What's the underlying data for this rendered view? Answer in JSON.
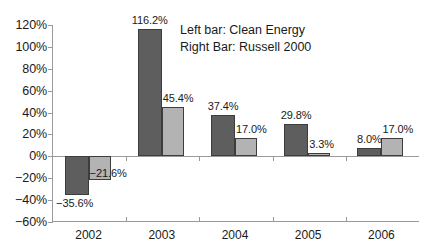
{
  "chart_data": {
    "type": "bar",
    "title": "",
    "subtitle": "",
    "xlabel": "",
    "ylabel": "",
    "categories": [
      "2002",
      "2003",
      "2004",
      "2005",
      "2006"
    ],
    "series": [
      {
        "name": "Clean Energy",
        "color": "#5e5e5e",
        "values": [
          -35.6,
          116.2,
          37.4,
          29.8,
          8.0
        ],
        "labels": [
          "−35.6%",
          "116.2%",
          "37.4%",
          "29.8%",
          "8.0%"
        ]
      },
      {
        "name": "Russell 2000",
        "color": "#b3b3b3",
        "values": [
          -21.6,
          45.4,
          17.0,
          3.3,
          17.0
        ],
        "labels": [
          "−21.6%",
          "45.4%",
          "17.0%",
          "3.3%",
          "17.0%"
        ]
      }
    ],
    "ylim": [
      -60,
      120
    ],
    "ytick_values": [
      120,
      100,
      80,
      60,
      40,
      20,
      0,
      -20,
      -40,
      -60
    ],
    "ytick_labels": [
      "120%",
      "100%",
      "80%",
      "60%",
      "40%",
      "20%",
      "0%",
      "−20%",
      "−40%",
      "−60%"
    ],
    "grid": false,
    "legend_position": "inside-top-right",
    "legend_lines": [
      "Left bar: Clean Energy",
      "Right Bar: Russell 2000"
    ],
    "axis_color": "#9a9a9a",
    "bar_edge_color": "#3d3d3d",
    "background_color": "#ffffff"
  }
}
